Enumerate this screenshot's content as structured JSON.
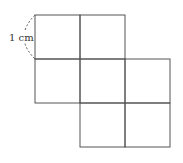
{
  "diagram": {
    "type": "square-grid-net",
    "unit_label": "1 cm",
    "square_size_px": 45,
    "origin": [
      35,
      15
    ],
    "cells": [
      {
        "row": 0,
        "col": 0
      },
      {
        "row": 0,
        "col": 1
      },
      {
        "row": 1,
        "col": 0
      },
      {
        "row": 1,
        "col": 1
      },
      {
        "row": 1,
        "col": 2
      },
      {
        "row": 2,
        "col": 1
      },
      {
        "row": 2,
        "col": 2
      }
    ],
    "line_color": "#555555",
    "annotation": {
      "text": "1 cm",
      "style": "dashed-arc",
      "side": "left-of-top-left-square"
    }
  }
}
